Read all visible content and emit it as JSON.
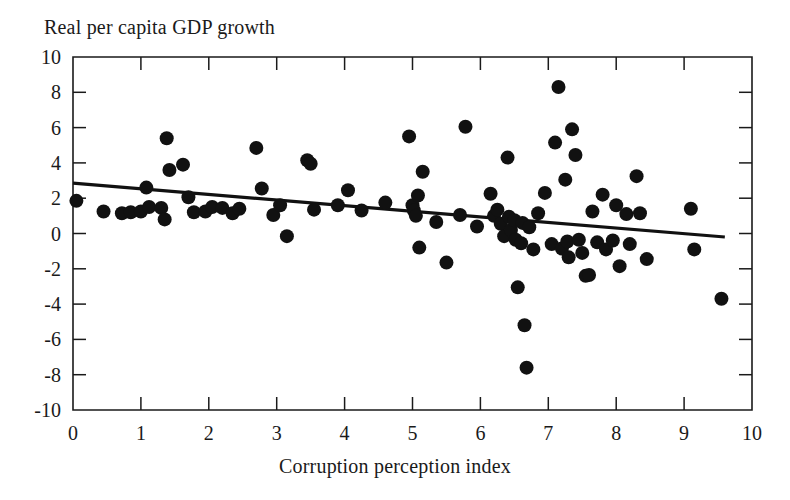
{
  "chart_data": {
    "type": "scatter",
    "title": "Real per capita GDP growth",
    "xlabel": "Corruption perception index",
    "ylabel": "Real per capita GDP growth",
    "xlim": [
      0,
      10
    ],
    "ylim": [
      -10,
      10
    ],
    "xticks": [
      0,
      1,
      2,
      3,
      4,
      5,
      6,
      7,
      8,
      9,
      10
    ],
    "yticks": [
      -10,
      -8,
      -6,
      -4,
      -2,
      0,
      2,
      4,
      6,
      8,
      10
    ],
    "xtick_labels": [
      "0",
      "1",
      "2",
      "3",
      "4",
      "5",
      "6",
      "7",
      "8",
      "9",
      "10"
    ],
    "ytick_labels": [
      "-10",
      "-8",
      "-6",
      "-4",
      "-2",
      "0",
      "2",
      "4",
      "6",
      "8",
      "10"
    ],
    "grid": false,
    "legend": null,
    "marker": "filled-circle",
    "marker_color": "#111111",
    "marker_radius_px": 7,
    "trendline": {
      "type": "linear-fit",
      "color": "#111111",
      "x_start": 0.0,
      "y_start": 2.85,
      "x_end": 9.6,
      "y_end": -0.2,
      "slope": -0.318,
      "intercept": 2.85
    },
    "points": [
      [
        0.05,
        1.85
      ],
      [
        0.45,
        1.25
      ],
      [
        0.72,
        1.15
      ],
      [
        0.85,
        1.2
      ],
      [
        1.0,
        1.25
      ],
      [
        1.08,
        2.6
      ],
      [
        1.12,
        1.5
      ],
      [
        1.3,
        1.45
      ],
      [
        1.35,
        0.8
      ],
      [
        1.38,
        5.4
      ],
      [
        1.42,
        3.6
      ],
      [
        1.62,
        3.9
      ],
      [
        1.7,
        2.05
      ],
      [
        1.78,
        1.2
      ],
      [
        1.95,
        1.25
      ],
      [
        2.05,
        1.5
      ],
      [
        2.2,
        1.45
      ],
      [
        2.35,
        1.15
      ],
      [
        2.45,
        1.4
      ],
      [
        2.7,
        4.85
      ],
      [
        2.78,
        2.55
      ],
      [
        2.95,
        1.05
      ],
      [
        3.05,
        1.6
      ],
      [
        3.15,
        -0.15
      ],
      [
        3.45,
        4.15
      ],
      [
        3.5,
        3.95
      ],
      [
        3.55,
        1.35
      ],
      [
        3.9,
        1.6
      ],
      [
        4.05,
        2.45
      ],
      [
        4.25,
        1.3
      ],
      [
        4.6,
        1.75
      ],
      [
        4.95,
        5.5
      ],
      [
        5.0,
        1.6
      ],
      [
        5.02,
        1.3
      ],
      [
        5.05,
        1.0
      ],
      [
        5.08,
        2.15
      ],
      [
        5.1,
        -0.8
      ],
      [
        5.15,
        3.5
      ],
      [
        5.35,
        0.65
      ],
      [
        5.5,
        -1.65
      ],
      [
        5.7,
        1.05
      ],
      [
        5.78,
        6.05
      ],
      [
        5.95,
        0.4
      ],
      [
        6.15,
        2.25
      ],
      [
        6.2,
        1.0
      ],
      [
        6.25,
        1.35
      ],
      [
        6.3,
        0.55
      ],
      [
        6.35,
        -0.15
      ],
      [
        6.4,
        4.3
      ],
      [
        6.42,
        0.95
      ],
      [
        6.45,
        0.2
      ],
      [
        6.5,
        0.75
      ],
      [
        6.52,
        -0.35
      ],
      [
        6.55,
        -3.05
      ],
      [
        6.6,
        -0.55
      ],
      [
        6.62,
        0.6
      ],
      [
        6.65,
        -5.2
      ],
      [
        6.68,
        -7.6
      ],
      [
        6.72,
        0.35
      ],
      [
        6.78,
        -0.9
      ],
      [
        6.85,
        1.15
      ],
      [
        6.95,
        2.3
      ],
      [
        7.05,
        -0.6
      ],
      [
        7.1,
        5.15
      ],
      [
        7.15,
        8.3
      ],
      [
        7.2,
        -0.85
      ],
      [
        7.25,
        3.05
      ],
      [
        7.28,
        -0.45
      ],
      [
        7.3,
        -1.35
      ],
      [
        7.35,
        5.9
      ],
      [
        7.4,
        4.45
      ],
      [
        7.45,
        -0.35
      ],
      [
        7.5,
        -1.1
      ],
      [
        7.55,
        -2.4
      ],
      [
        7.6,
        -2.35
      ],
      [
        7.65,
        1.25
      ],
      [
        7.72,
        -0.5
      ],
      [
        7.8,
        2.2
      ],
      [
        7.85,
        -0.9
      ],
      [
        7.95,
        -0.4
      ],
      [
        8.0,
        1.6
      ],
      [
        8.05,
        -1.85
      ],
      [
        8.15,
        1.1
      ],
      [
        8.2,
        -0.6
      ],
      [
        8.3,
        3.25
      ],
      [
        8.35,
        1.15
      ],
      [
        8.45,
        -1.45
      ],
      [
        9.1,
        1.4
      ],
      [
        9.15,
        -0.9
      ],
      [
        9.55,
        -3.7
      ]
    ]
  }
}
